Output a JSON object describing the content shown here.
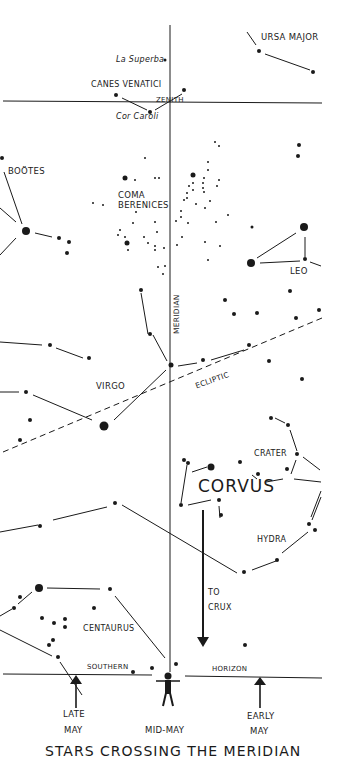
{
  "figure": {
    "title": "STARS CROSSING THE MERIDIAN",
    "colors": {
      "ink": "#1a1a1a",
      "background": "#ffffff"
    }
  },
  "labels": {
    "ursa_major": "URSA MAJOR",
    "la_superba": "La Superba",
    "canes_venatici": "CANES VENATICI",
    "zenith": "ZENITH",
    "cor_caroli": "Cor Caroli",
    "bootes": "BOÖTES",
    "coma_line1": "COMA",
    "coma_line2": "BERENICES",
    "leo": "LEO",
    "meridian": "MERIDIAN",
    "ecliptic": "ECLIPTIC",
    "virgo": "VIRGO",
    "crater": "CRATER",
    "corvus": "CORVUS",
    "hydra": "HYDRA",
    "to": "TO",
    "crux": "CRUX",
    "centaurus": "CENTAURUS",
    "southern": "SOUTHERN",
    "horizon": "HORIZON",
    "late": "LATE",
    "late_may": "MAY",
    "mid_may": "MID-MAY",
    "early": "EARLY",
    "early_may": "MAY"
  },
  "markers": {
    "late_may_arrow": "up-arrow-icon",
    "early_may_arrow": "up-arrow-icon",
    "crux_arrow": "down-arrow-icon",
    "observer": "person-icon"
  }
}
